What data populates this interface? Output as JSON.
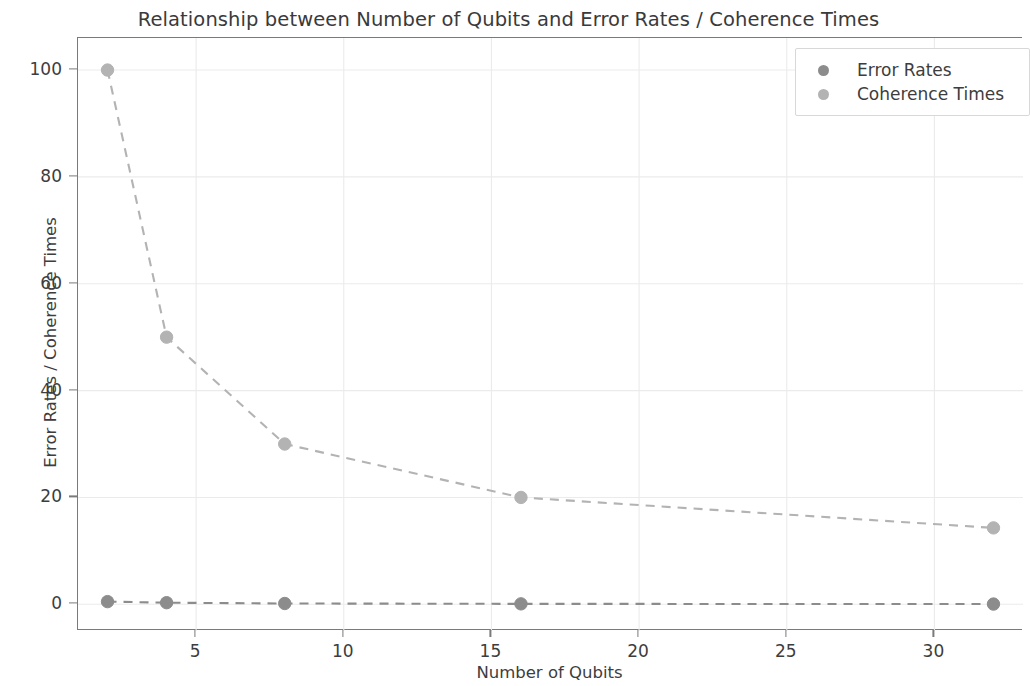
{
  "chart_data": {
    "type": "line",
    "title": "Relationship between Number of Qubits and Error Rates / Coherence Times",
    "xlabel": "Number of Qubits",
    "ylabel": "Error Rates / Coherence Times",
    "xlim": [
      1.0,
      33.0
    ],
    "ylim": [
      -5.0,
      106.0
    ],
    "xticks": [
      5,
      10,
      15,
      20,
      25,
      30
    ],
    "xtick_labels": [
      "5",
      "10",
      "15",
      "20",
      "25",
      "30"
    ],
    "yticks": [
      0,
      20,
      40,
      60,
      80,
      100
    ],
    "ytick_labels": [
      "0",
      "20",
      "40",
      "60",
      "80",
      "100"
    ],
    "grid": true,
    "legend_position": "upper right",
    "x": [
      2,
      4,
      8,
      16,
      32
    ],
    "series": [
      {
        "name": "Error Rates",
        "values": [
          0.5,
          0.3,
          0.15,
          0.08,
          0.04
        ],
        "color": "#8c8c8c",
        "linestyle": "dashed",
        "marker": "circle"
      },
      {
        "name": "Coherence Times",
        "values": [
          100,
          50,
          30,
          20,
          14.3
        ],
        "color": "#b3b3b3",
        "linestyle": "dashed",
        "marker": "circle"
      }
    ]
  },
  "style": {
    "grid_color": "#ebebeb",
    "axis_color": "#7a7a7a",
    "text_color": "#3d3d3d",
    "background": "#ffffff"
  }
}
